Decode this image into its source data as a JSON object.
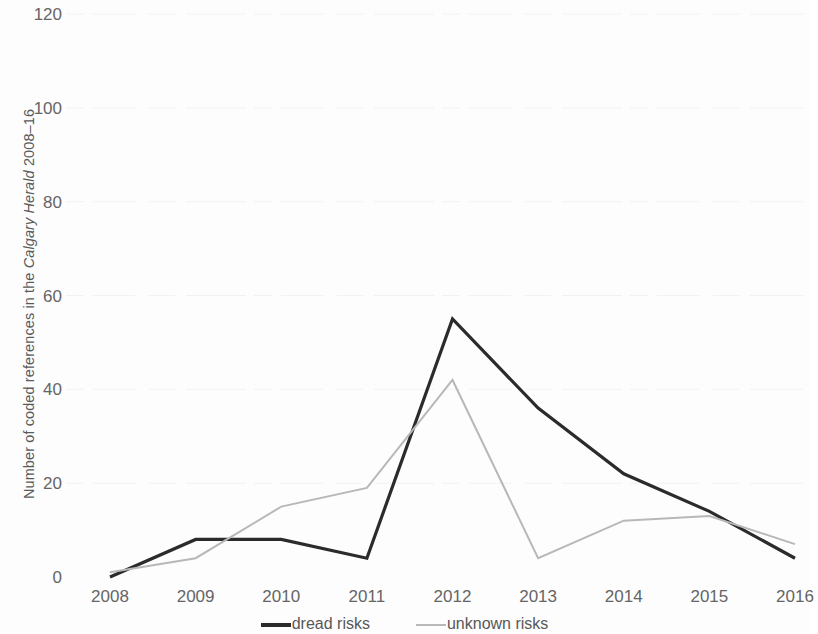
{
  "chart_data": {
    "type": "line",
    "title": "",
    "xlabel": "",
    "ylabel": "Number of coded references in the Calgary Herald 2008–16",
    "ylabel_parts": {
      "before": "Number of coded references in the ",
      "italic": "Calgary Herald",
      "after": " 2008–16"
    },
    "categories": [
      "2008",
      "2009",
      "2010",
      "2011",
      "2012",
      "2013",
      "2014",
      "2015",
      "2016"
    ],
    "x": [
      2008,
      2009,
      2010,
      2011,
      2012,
      2013,
      2014,
      2015,
      2016
    ],
    "series": [
      {
        "name": "dread risks",
        "color": "#2b2b2b",
        "line_width": 3.2,
        "values": [
          0,
          8,
          8,
          4,
          55,
          36,
          22,
          14,
          4
        ]
      },
      {
        "name": "unknown risks",
        "color": "#b8b8b8",
        "line_width": 2.0,
        "values": [
          1,
          4,
          15,
          19,
          42,
          4,
          12,
          13,
          7
        ]
      }
    ],
    "ylim": [
      0,
      120
    ],
    "yticks": [
      0,
      20,
      40,
      60,
      80,
      100,
      120
    ],
    "ytick_labels": [
      "0",
      "20",
      "40",
      "60",
      "80",
      "100",
      "120"
    ],
    "grid": "horizontal-faint",
    "grid_color": "#f2f2f2",
    "legend_position": "bottom-center"
  },
  "legend": {
    "entries": [
      {
        "label": "dread risks",
        "swatch": "dread"
      },
      {
        "label": "unknown risks",
        "swatch": "unknown"
      }
    ]
  },
  "colors": {
    "background": "#fdfdfd",
    "text": "#5a5a5a",
    "tick_text": "#656565",
    "series_dread": "#2b2b2b",
    "series_unknown": "#b8b8b8",
    "gridline": "#f2f2f2"
  }
}
